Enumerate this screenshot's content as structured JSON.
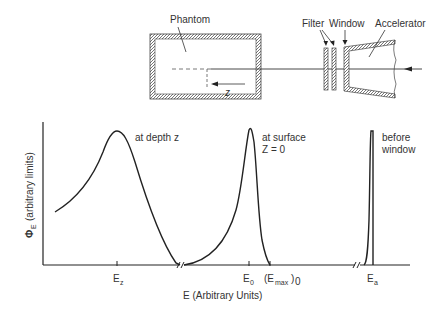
{
  "schematic": {
    "phantom_label": "Phantom",
    "filter_label": "Filter",
    "window_label": "Window",
    "accelerator_label": "Accelerator",
    "depth_label": "z"
  },
  "plot": {
    "y_axis_symbol": "Φ",
    "y_axis_subscript": "E",
    "y_axis_label": "(arbitrary limits)",
    "x_axis_label": "E (Arbitrary Units)",
    "ticks": {
      "ez": "E",
      "ez_sub": "z",
      "e0": "E",
      "e0_sub": "0",
      "emax": "(E",
      "emax_sub": "max",
      "emax_close": ")",
      "emax_sub2": "0",
      "ea": "E",
      "ea_sub": "a"
    },
    "curves": {
      "depth_label": "at depth z",
      "surface_label_1": "at surface",
      "surface_label_2": "Z = 0",
      "window_label_1": "before",
      "window_label_2": "window"
    }
  }
}
